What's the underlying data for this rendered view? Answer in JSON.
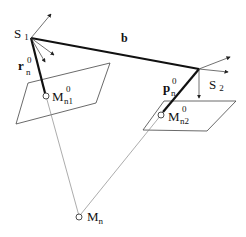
{
  "diagram": {
    "labels": {
      "s1": "S",
      "s1_sub": "1",
      "s2": "S",
      "s2_sub": "2",
      "b": "b",
      "r": "r",
      "r_sup": "0",
      "r_sub": "n",
      "p": "p",
      "p_sup": "0",
      "p_sub": "n",
      "mn1": "M",
      "mn1_sup": "0",
      "mn1_sub": "n1",
      "mn2": "M",
      "mn2_sup": "0",
      "mn2_sub": "n2",
      "mn": "M",
      "mn_sub": "n"
    },
    "colors": {
      "line": "#111111",
      "thin": "#555555",
      "ray": "#888888"
    }
  }
}
